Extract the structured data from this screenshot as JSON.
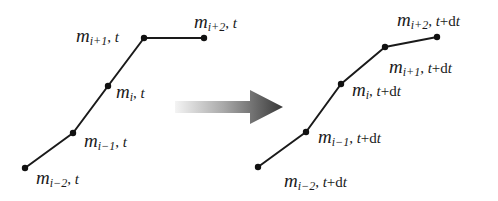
{
  "diagram": {
    "colors": {
      "line": "#1a1a1a",
      "node": "#111111",
      "arrow_dark": "#3a3a3a",
      "arrow_light": "#f2f2f2"
    },
    "before": {
      "time_label": "t",
      "nodes": [
        {
          "id": "i-2",
          "x": 25,
          "y": 168,
          "var": "m",
          "sub": "i−2",
          "time": "t"
        },
        {
          "id": "i-1",
          "x": 73,
          "y": 133,
          "var": "m",
          "sub": "i−1",
          "time": "t"
        },
        {
          "id": "i",
          "x": 108,
          "y": 86,
          "var": "m",
          "sub": "i",
          "time": "t"
        },
        {
          "id": "i+1",
          "x": 144,
          "y": 38,
          "var": "m",
          "sub": "i+1",
          "time": "t"
        },
        {
          "id": "i+2",
          "x": 204,
          "y": 38,
          "var": "m",
          "sub": "i+2",
          "time": "t"
        }
      ]
    },
    "after": {
      "time_label": "t+dt",
      "nodes": [
        {
          "id": "i-2",
          "x": 258,
          "y": 167,
          "var": "m",
          "sub": "i−2",
          "time": "t+dt"
        },
        {
          "id": "i-1",
          "x": 306,
          "y": 132,
          "var": "m",
          "sub": "i−1",
          "time": "t+dt"
        },
        {
          "id": "i",
          "x": 341,
          "y": 84,
          "var": "m",
          "sub": "i",
          "time": "t+dt"
        },
        {
          "id": "i+1",
          "x": 385,
          "y": 47,
          "var": "m",
          "sub": "i+1",
          "time": "t+dt"
        },
        {
          "id": "i+2",
          "x": 437,
          "y": 37,
          "var": "m",
          "sub": "i+2",
          "time": "t+dt"
        }
      ]
    },
    "labels": {
      "before": {
        "i-2": {
          "m": "m",
          "sub": "i−2",
          "sep": ", ",
          "time": "t"
        },
        "i-1": {
          "m": "m",
          "sub": "i−1",
          "sep": ", ",
          "time": "t"
        },
        "i": {
          "m": "m",
          "sub": "i",
          "sep": ", ",
          "time": "t"
        },
        "i+1": {
          "m": "m",
          "sub": "i+1",
          "sep": ", ",
          "time": "t"
        },
        "i+2": {
          "m": "m",
          "sub": "i+2",
          "sep": ", ",
          "time": "t"
        }
      },
      "after": {
        "i-2": {
          "m": "m",
          "sub": "i−2",
          "sep": ", ",
          "time_t": "t",
          "time_rest": "+d",
          "time_t2": "t"
        },
        "i-1": {
          "m": "m",
          "sub": "i−1",
          "sep": ", ",
          "time_t": "t",
          "time_rest": "+d",
          "time_t2": "t"
        },
        "i": {
          "m": "m",
          "sub": "i",
          "sep": ", ",
          "time_t": "t",
          "time_rest": "+d",
          "time_t2": "t"
        },
        "i+1": {
          "m": "m",
          "sub": "i+1",
          "sep": ", ",
          "time_t": "t",
          "time_rest": "+d",
          "time_t2": "t"
        },
        "i+2": {
          "m": "m",
          "sub": "i+2",
          "sep": ", ",
          "time_t": "t",
          "time_rest": "+d",
          "time_t2": "t"
        }
      }
    },
    "arrow": {
      "icon": "right-arrow-icon",
      "from_x": 175,
      "to_x": 282,
      "y": 107
    }
  }
}
